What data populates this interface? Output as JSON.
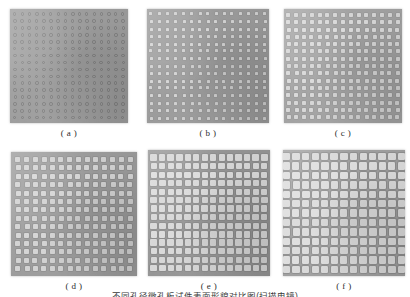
{
  "figure": {
    "width": 410,
    "height": 297,
    "background": "#ffffff",
    "note_text": "不同孔径微孔板试件表面形貌对比图(扫描电镜)",
    "note_visible_fraction": "top sliver only, clipped by image bottom edge"
  },
  "panels": [
    {
      "id": "a",
      "caption": "( a )",
      "x": 10,
      "y": 9,
      "width": 118,
      "height": 114,
      "plate_color": "#9d9d9d",
      "hole_style": "ring",
      "hole_color": "#8a8a8a",
      "hole_ring_color": "#7c7c7c",
      "hole_size": 3.4,
      "pitch_x": 7.2,
      "pitch_y": 6.9,
      "cols": 16,
      "rows": 16,
      "description": "smallest circular micro-holes, dense ring pattern"
    },
    {
      "id": "b",
      "caption": "( b )",
      "x": 147,
      "y": 9,
      "width": 122,
      "height": 114,
      "plate_color": "#9a9a9a",
      "hole_style": "sq",
      "hole_color": "#d6d6d6",
      "hole_ring_color": "#8f8f8f",
      "hole_size": 3.0,
      "pitch_x": 8.1,
      "pitch_y": 7.4,
      "cols": 15,
      "rows": 15,
      "description": "small square holes, bright centres"
    },
    {
      "id": "c",
      "caption": "( c )",
      "x": 284,
      "y": 9,
      "width": 118,
      "height": 114,
      "plate_color": "#a2a2a2",
      "hole_style": "sq",
      "hole_color": "#dcdcdc",
      "hole_ring_color": "#949494",
      "hole_size": 4.0,
      "pitch_x": 7.8,
      "pitch_y": 7.3,
      "cols": 15,
      "rows": 15,
      "description": "square holes slightly larger than (b)"
    },
    {
      "id": "d",
      "caption": "( d )",
      "x": 11,
      "y": 152,
      "width": 126,
      "height": 124,
      "plate_color": "#9b9b9b",
      "hole_style": "sq",
      "hole_color": "#d8d8d8",
      "hole_ring_color": "#8c8c8c",
      "hole_size": 5.0,
      "pitch_x": 8.6,
      "pitch_y": 8.4,
      "cols": 14,
      "rows": 14,
      "description": "medium square holes, regular lattice"
    },
    {
      "id": "e",
      "caption": "( e )",
      "x": 148,
      "y": 150,
      "width": 122,
      "height": 126,
      "plate_color": "#949494",
      "hole_style": "sq",
      "hole_color": "#dedede",
      "hole_ring_color": "#878787",
      "hole_size": 6.2,
      "pitch_x": 8.5,
      "pitch_y": 8.5,
      "cols": 14,
      "rows": 14,
      "description": "larger square holes, thinner ligaments"
    },
    {
      "id": "f",
      "caption": "( f )",
      "x": 283,
      "y": 150,
      "width": 122,
      "height": 126,
      "plate_color": "#9f9f9f",
      "hole_style": "sq",
      "hole_color": "#e2e2e2",
      "hole_ring_color": "#8d8d8d",
      "hole_size": 7.4,
      "pitch_x": 9.6,
      "pitch_y": 9.4,
      "cols": 13,
      "rows": 13,
      "description": "largest square holes, widest apertures"
    }
  ]
}
